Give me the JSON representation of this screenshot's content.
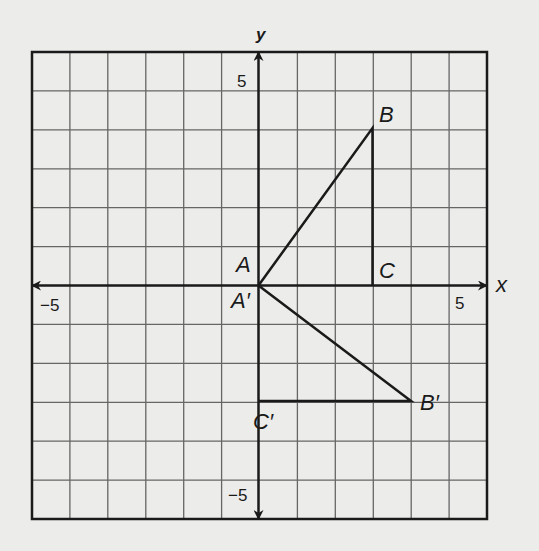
{
  "diagram": {
    "type": "coordinate-plane",
    "axes": {
      "x_label": "x",
      "y_label": "y",
      "x_range": [
        -6,
        6
      ],
      "y_range": [
        -6,
        6
      ]
    },
    "ticks": {
      "x_neg": "−5",
      "x_pos": "5",
      "y_pos": "5",
      "y_neg": "−5"
    },
    "points": [
      {
        "name": "A",
        "x": 0,
        "y": 0
      },
      {
        "name": "B",
        "x": 3,
        "y": 4
      },
      {
        "name": "C",
        "x": 3,
        "y": 0
      },
      {
        "name": "A′",
        "x": 0,
        "y": 0
      },
      {
        "name": "B′",
        "x": 4,
        "y": -3
      },
      {
        "name": "C′",
        "x": 0,
        "y": -3
      }
    ],
    "labels": {
      "A": "A",
      "B": "B",
      "C": "C",
      "A_prime": "A′",
      "B_prime": "B′",
      "C_prime": "C′"
    },
    "colors": {
      "background": "#ececea",
      "ink": "#1a1a1a",
      "grid": "#555555"
    }
  }
}
